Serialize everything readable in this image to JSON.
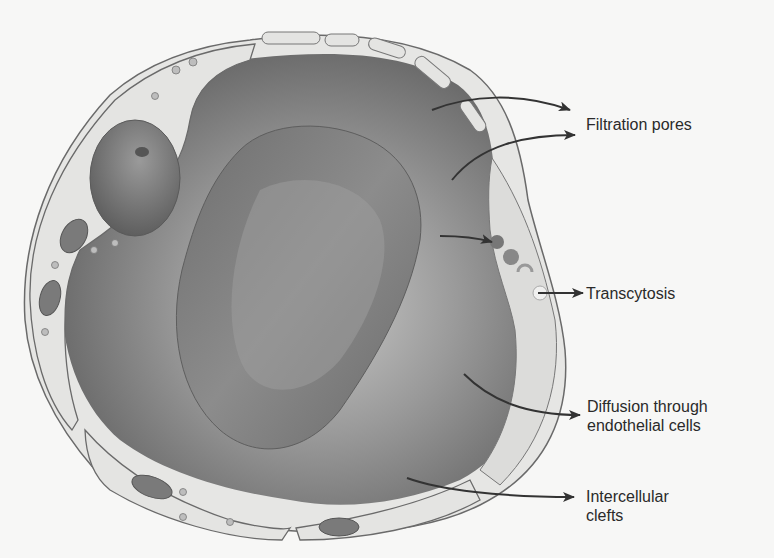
{
  "figure": {
    "colors": {
      "background": "#f7f7f6",
      "lumen_dark": "#5e5e5e",
      "lumen_mid": "#8a8a8a",
      "endothelium": "#e4e4e2",
      "outline": "#6a6a6a",
      "rbc": "#7a7a7a",
      "arrow": "#333333",
      "text": "#2a2a2a"
    }
  },
  "labels": [
    {
      "id": "filtration-pores",
      "lines": [
        "Filtration pores"
      ]
    },
    {
      "id": "transcytosis",
      "lines": [
        "Transcytosis"
      ]
    },
    {
      "id": "diffusion",
      "lines": [
        "Diffusion through",
        "endothelial cells"
      ]
    },
    {
      "id": "intercellular-clefts",
      "lines": [
        "Intercellular",
        "clefts"
      ]
    }
  ],
  "structures": {
    "capillary_wall": "endothelial-cells",
    "lumen_contents": "red-blood-cell",
    "nucleus": "endothelial-nucleus",
    "organelles": [
      "mitochondria",
      "vesicles"
    ]
  }
}
